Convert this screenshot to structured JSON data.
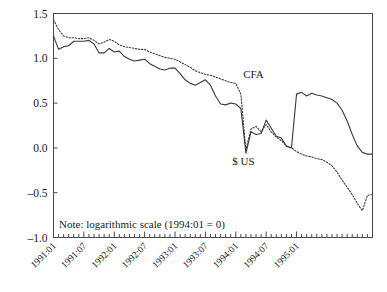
{
  "chart_data": {
    "type": "line",
    "title": "",
    "xlabel": "",
    "ylabel": "",
    "note": "Note: logarithmic scale (1994:01 = 0)",
    "grid": false,
    "legend_position": "inline-annotations",
    "ylim": [
      -1.0,
      1.5
    ],
    "ytick_labels": [
      "1.5",
      "1.0",
      "0.5",
      "0.0",
      "-0.5",
      "-1.0"
    ],
    "ytick_values": [
      1.5,
      1.0,
      0.5,
      0.0,
      -0.5,
      -1.0
    ],
    "xtick_labels": [
      "1991:01",
      "1991:07",
      "1992:01",
      "1992:07",
      "1993:01",
      "1993:07",
      "1994:01",
      "1994:07",
      "1995:01"
    ],
    "xtick_values": [
      0,
      6,
      12,
      18,
      24,
      30,
      36,
      42,
      48
    ],
    "x_minor_step_months": 1,
    "x_range": [
      0,
      53
    ],
    "annotations": [
      {
        "name": "CFA",
        "text": "CFA",
        "x": 39.5,
        "y": 0.78
      },
      {
        "name": "$ US",
        "text": "$ US",
        "x": 37.5,
        "y": -0.19
      }
    ],
    "series": [
      {
        "name": "CFA",
        "style": "solid",
        "x": [
          0,
          1,
          2,
          3,
          4,
          5,
          6,
          7,
          8,
          9,
          10,
          11,
          12,
          13,
          14,
          15,
          16,
          17,
          18,
          19,
          20,
          21,
          22,
          23,
          24,
          25,
          26,
          27,
          28,
          29,
          30,
          31,
          32,
          33,
          34,
          35,
          36,
          37,
          38,
          39,
          40,
          41,
          42,
          43,
          44,
          45,
          46,
          47,
          48,
          49,
          50,
          51,
          52,
          53
        ],
        "values": [
          1.25,
          1.1,
          1.13,
          1.14,
          1.19,
          1.19,
          1.19,
          1.2,
          1.16,
          1.06,
          1.06,
          1.11,
          1.07,
          1.08,
          1.02,
          0.99,
          0.97,
          0.98,
          0.99,
          0.94,
          0.91,
          0.88,
          0.87,
          0.89,
          0.89,
          0.83,
          0.76,
          0.72,
          0.7,
          0.73,
          0.76,
          0.7,
          0.58,
          0.49,
          0.48,
          0.5,
          0.49,
          0.44,
          -0.06,
          0.18,
          0.15,
          0.16,
          0.31,
          0.22,
          0.13,
          0.11,
          0.02,
          0.0,
          0.6,
          0.62,
          0.58,
          0.61,
          0.59,
          0.58
        ]
      },
      {
        "name": "$ US",
        "style": "dotted",
        "x": [
          0,
          1,
          2,
          3,
          4,
          5,
          6,
          7,
          8,
          9,
          10,
          11,
          12,
          13,
          14,
          15,
          16,
          17,
          18,
          19,
          20,
          21,
          22,
          23,
          24,
          25,
          26,
          27,
          28,
          29,
          30,
          31,
          32,
          33,
          34,
          35,
          36,
          37,
          38,
          39,
          40,
          41,
          42,
          43,
          44,
          45,
          46,
          47,
          48,
          49,
          50,
          51,
          52,
          53
        ],
        "values": [
          1.43,
          1.32,
          1.25,
          1.23,
          1.23,
          1.22,
          1.22,
          1.23,
          1.2,
          1.16,
          1.18,
          1.21,
          1.19,
          1.15,
          1.13,
          1.12,
          1.11,
          1.1,
          1.1,
          1.07,
          1.05,
          1.03,
          1.01,
          1.0,
          0.99,
          0.96,
          0.93,
          0.9,
          0.86,
          0.84,
          0.82,
          0.81,
          0.79,
          0.77,
          0.75,
          0.73,
          0.72,
          0.6,
          -0.02,
          0.21,
          0.24,
          0.18,
          0.26,
          0.18,
          0.12,
          0.08,
          0.02,
          0.0,
          -0.04,
          -0.07,
          -0.09,
          -0.1,
          -0.12,
          -0.13
        ]
      }
    ],
    "series_tail": [
      {
        "name": "CFA",
        "x": [
          53,
          54,
          55,
          56,
          57,
          58,
          59,
          60,
          61,
          62,
          63
        ],
        "values": [
          0.58,
          0.56,
          0.54,
          0.5,
          0.42,
          0.3,
          0.15,
          0.02,
          -0.05,
          -0.07,
          -0.07
        ]
      },
      {
        "name": "$ US",
        "x": [
          53,
          54,
          55,
          56,
          57,
          58,
          59,
          60,
          61,
          62,
          63
        ],
        "values": [
          -0.13,
          -0.16,
          -0.2,
          -0.27,
          -0.36,
          -0.44,
          -0.52,
          -0.62,
          -0.7,
          -0.53,
          -0.52
        ]
      }
    ]
  },
  "axes": {
    "y_axis_name": "y-axis",
    "x_axis_name": "x-axis"
  }
}
